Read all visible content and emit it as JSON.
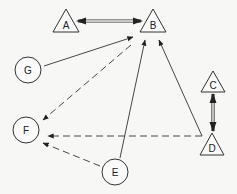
{
  "diagram": {
    "type": "directed-graph",
    "colors": {
      "line": "#333333",
      "background": "#f7f7f5",
      "node_fill": "#fafafa"
    },
    "nodes": [
      {
        "id": "A",
        "label": "A",
        "shape": "triangle"
      },
      {
        "id": "B",
        "label": "B",
        "shape": "triangle"
      },
      {
        "id": "C",
        "label": "C",
        "shape": "triangle"
      },
      {
        "id": "D",
        "label": "D",
        "shape": "triangle"
      },
      {
        "id": "E",
        "label": "E",
        "shape": "circle"
      },
      {
        "id": "F",
        "label": "F",
        "shape": "circle"
      },
      {
        "id": "G",
        "label": "G",
        "shape": "circle"
      }
    ],
    "edges": [
      {
        "from": "A",
        "to": "B",
        "style": "double-line",
        "direction": "bidirectional"
      },
      {
        "from": "C",
        "to": "D",
        "style": "double-line",
        "direction": "bidirectional"
      },
      {
        "from": "G",
        "to": "B",
        "style": "solid",
        "direction": "forward"
      },
      {
        "from": "E",
        "to": "B",
        "style": "solid",
        "direction": "forward"
      },
      {
        "from": "D",
        "to": "B",
        "style": "solid",
        "direction": "forward"
      },
      {
        "from": "B",
        "to": "F",
        "style": "dashed",
        "direction": "forward"
      },
      {
        "from": "D",
        "to": "F",
        "style": "dashed",
        "direction": "forward"
      },
      {
        "from": "E",
        "to": "F",
        "style": "dashed",
        "direction": "forward"
      }
    ]
  }
}
